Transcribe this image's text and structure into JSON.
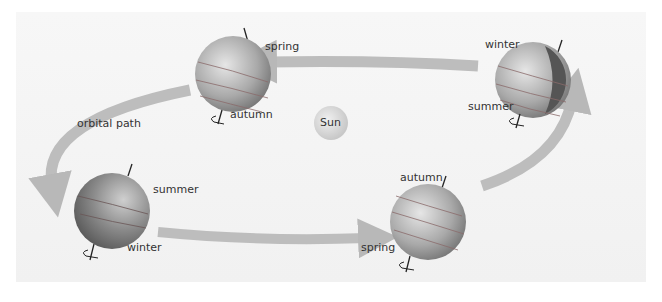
{
  "diagram": {
    "sun": {
      "label": "Sun",
      "color": "#d9d9d9"
    },
    "orbit_label": "orbital path",
    "earth_positions": [
      {
        "id": "top-left",
        "labels": [
          "spring",
          "autumn"
        ]
      },
      {
        "id": "top-right",
        "labels": [
          "winter",
          "summer"
        ]
      },
      {
        "id": "bottom-left",
        "labels": [
          "summer",
          "winter"
        ]
      },
      {
        "id": "bottom-right",
        "labels": [
          "autumn",
          "spring"
        ]
      }
    ],
    "colors": {
      "arrow": "#b8b8b8",
      "earth_light": "#d8d8d8",
      "earth_dark": "#6a6a6a",
      "text": "#333333"
    }
  }
}
